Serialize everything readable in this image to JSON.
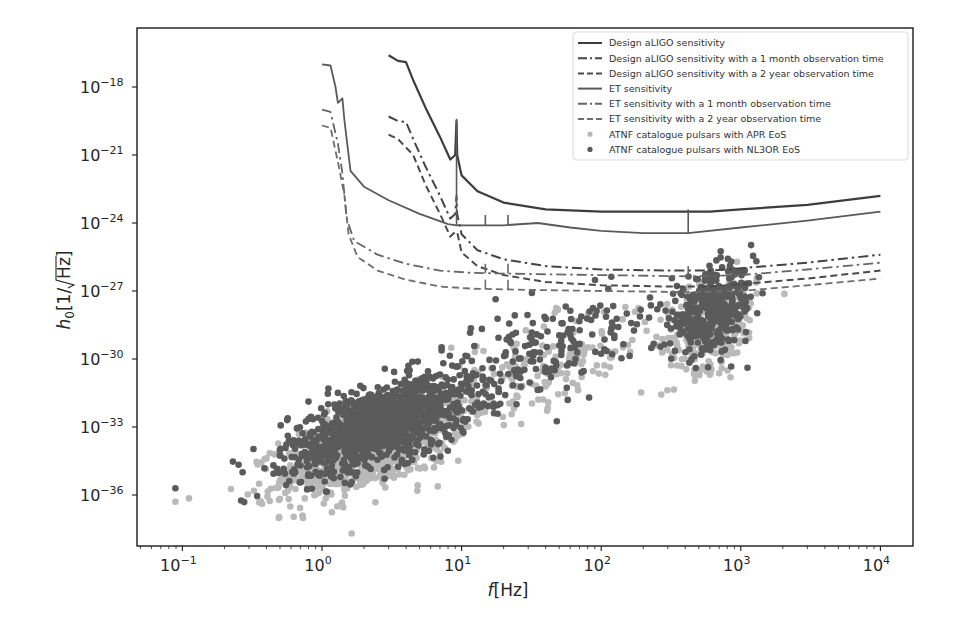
{
  "chart_data": {
    "type": "scatter",
    "title": "",
    "xlabel": "f[Hz]",
    "ylabel": "h0[1/√Hz]",
    "xscale": "log",
    "yscale": "log",
    "xlim": [
      0.05,
      20000
    ],
    "ylim": [
      1e-38,
      1e-16
    ],
    "grid": false,
    "legend_position": "upper right",
    "x_ticks": [
      {
        "exp": "−1",
        "value": 0.1
      },
      {
        "exp": "0",
        "value": 1
      },
      {
        "exp": "1",
        "value": 10
      },
      {
        "exp": "2",
        "value": 100
      },
      {
        "exp": "3",
        "value": 1000
      },
      {
        "exp": "4",
        "value": 10000
      }
    ],
    "y_ticks": [
      {
        "exp": "−18",
        "value": 1e-18
      },
      {
        "exp": "−21",
        "value": 1e-21
      },
      {
        "exp": "−24",
        "value": 1e-24
      },
      {
        "exp": "−27",
        "value": 1e-27
      },
      {
        "exp": "−30",
        "value": 1e-30
      },
      {
        "exp": "−33",
        "value": 1e-33
      },
      {
        "exp": "−36",
        "value": 1e-36
      }
    ],
    "series": [
      {
        "name": "Design aLIGO sensitivity",
        "kind": "line",
        "style": "solid",
        "color": "#3d3d3d",
        "width": 2.2,
        "points": [
          [
            3.0,
            -16.6
          ],
          [
            3.5,
            -16.85
          ],
          [
            4.0,
            -16.9
          ],
          [
            4.5,
            -17.7
          ],
          [
            5.5,
            -18.9
          ],
          [
            7,
            -20.2
          ],
          [
            8.3,
            -21.2
          ],
          [
            9.0,
            -21.0
          ],
          [
            9.2,
            -19.5
          ],
          [
            9.3,
            -21.0
          ],
          [
            10,
            -21.9
          ],
          [
            13,
            -22.6
          ],
          [
            20,
            -23.1
          ],
          [
            40,
            -23.4
          ],
          [
            100,
            -23.5
          ],
          [
            300,
            -23.5
          ],
          [
            600,
            -23.5
          ],
          [
            1000,
            -23.4
          ],
          [
            3000,
            -23.2
          ],
          [
            10000,
            -22.8
          ]
        ],
        "spikes": []
      },
      {
        "name": "Design aLIGO sensitivity with a 1 month observation time",
        "kind": "line",
        "style": "dashdot",
        "color": "#454545",
        "width": 2.0,
        "points": [
          [
            3.0,
            -19.3
          ],
          [
            3.5,
            -19.5
          ],
          [
            4.0,
            -19.55
          ],
          [
            4.5,
            -20.3
          ],
          [
            5.5,
            -21.5
          ],
          [
            7,
            -22.8
          ],
          [
            8.3,
            -23.8
          ],
          [
            9.0,
            -23.6
          ],
          [
            9.2,
            -22.8
          ],
          [
            9.3,
            -23.6
          ],
          [
            10,
            -24.5
          ],
          [
            13,
            -25.2
          ],
          [
            20,
            -25.6
          ],
          [
            40,
            -25.9
          ],
          [
            100,
            -26.05
          ],
          [
            300,
            -26.1
          ],
          [
            600,
            -26.1
          ],
          [
            1000,
            -26.0
          ],
          [
            3000,
            -25.75
          ],
          [
            10000,
            -25.4
          ]
        ],
        "spikes": []
      },
      {
        "name": "Design aLIGO sensitivity with a 2 year observation time",
        "kind": "line",
        "style": "dashed",
        "color": "#4a4a4a",
        "width": 2.0,
        "points": [
          [
            3.0,
            -20.1
          ],
          [
            3.5,
            -20.3
          ],
          [
            4.5,
            -21.0
          ],
          [
            5.5,
            -22.3
          ],
          [
            7,
            -23.6
          ],
          [
            8.3,
            -24.6
          ],
          [
            9.0,
            -24.4
          ],
          [
            9.3,
            -24.4
          ],
          [
            10,
            -25.3
          ],
          [
            13,
            -25.9
          ],
          [
            20,
            -26.3
          ],
          [
            40,
            -26.6
          ],
          [
            100,
            -26.75
          ],
          [
            300,
            -26.8
          ],
          [
            600,
            -26.8
          ],
          [
            1000,
            -26.7
          ],
          [
            3000,
            -26.45
          ],
          [
            10000,
            -26.1
          ]
        ],
        "spikes": []
      },
      {
        "name": "ET sensitivity",
        "kind": "line",
        "style": "solid",
        "color": "#5a5a5a",
        "width": 1.8,
        "points": [
          [
            1.0,
            -17.0
          ],
          [
            1.15,
            -17.05
          ],
          [
            1.25,
            -18.0
          ],
          [
            1.3,
            -18.7
          ],
          [
            1.4,
            -18.5
          ],
          [
            1.45,
            -19.5
          ],
          [
            1.6,
            -21.7
          ],
          [
            2,
            -22.4
          ],
          [
            3,
            -23.0
          ],
          [
            5,
            -23.6
          ],
          [
            8,
            -24.05
          ],
          [
            9.2,
            -24.1
          ],
          [
            12,
            -24.1
          ],
          [
            20,
            -24.1
          ],
          [
            35,
            -24.0
          ],
          [
            60,
            -24.2
          ],
          [
            100,
            -24.35
          ],
          [
            200,
            -24.45
          ],
          [
            420,
            -24.45
          ],
          [
            1000,
            -24.2
          ],
          [
            3000,
            -23.9
          ],
          [
            10000,
            -23.5
          ]
        ],
        "spikes": [
          [
            9.2,
            -19.4
          ],
          [
            14.8,
            -23.65
          ],
          [
            21.5,
            -23.65
          ],
          [
            420,
            -23.4
          ]
        ]
      },
      {
        "name": "ET sensitivity with a 1 month observation time",
        "kind": "line",
        "style": "dashdot",
        "color": "#666666",
        "width": 1.8,
        "points": [
          [
            1.0,
            -19.0
          ],
          [
            1.15,
            -19.1
          ],
          [
            1.3,
            -20.5
          ],
          [
            1.4,
            -21.8
          ],
          [
            1.5,
            -23.8
          ],
          [
            1.7,
            -24.8
          ],
          [
            2.5,
            -25.4
          ],
          [
            4,
            -25.8
          ],
          [
            7,
            -26.1
          ],
          [
            12,
            -26.2
          ],
          [
            30,
            -26.25
          ],
          [
            100,
            -26.3
          ],
          [
            420,
            -26.35
          ],
          [
            1000,
            -26.3
          ],
          [
            3000,
            -26.05
          ],
          [
            10000,
            -25.75
          ]
        ],
        "spikes": [
          [
            14.8,
            -25.8
          ],
          [
            21.5,
            -25.8
          ],
          [
            420,
            -25.9
          ]
        ]
      },
      {
        "name": "ET sensitivity with a 2 year observation time",
        "kind": "line",
        "style": "dashed",
        "color": "#6e6e6e",
        "width": 1.8,
        "points": [
          [
            1.0,
            -19.7
          ],
          [
            1.15,
            -19.8
          ],
          [
            1.3,
            -21.3
          ],
          [
            1.45,
            -22.8
          ],
          [
            1.55,
            -24.5
          ],
          [
            1.8,
            -25.5
          ],
          [
            2.5,
            -26.1
          ],
          [
            4,
            -26.5
          ],
          [
            7,
            -26.8
          ],
          [
            12,
            -26.9
          ],
          [
            30,
            -26.95
          ],
          [
            100,
            -27.0
          ],
          [
            420,
            -27.05
          ],
          [
            1000,
            -27.0
          ],
          [
            3000,
            -26.75
          ],
          [
            10000,
            -26.45
          ]
        ],
        "spikes": [
          [
            14.8,
            -26.5
          ],
          [
            21.5,
            -26.5
          ]
        ]
      },
      {
        "name": "ATNF catalogue pulsars with APR EoS",
        "kind": "scatter",
        "color": "#b9b9b9",
        "radius": 3.3,
        "clusters": [
          {
            "n": 1000,
            "logf_mean": 0.38,
            "logf_sd": 0.33,
            "logh_mean": -33.8,
            "logh_sd": 1.15,
            "corr": 0.6
          },
          {
            "n": 320,
            "logf_mean": 2.8,
            "logf_sd": 0.16,
            "logh_mean": -28.5,
            "logh_sd": 1.0,
            "corr": 0.3
          },
          {
            "n": 160,
            "logf_mean": 1.6,
            "logf_sd": 0.4,
            "logh_mean": -30.3,
            "logh_sd": 1.2,
            "corr": 0.6
          }
        ]
      },
      {
        "name": "ATNF catalogue pulsars with NL3OR EoS",
        "kind": "scatter",
        "color": "#5b5b5b",
        "radius": 3.3,
        "clusters": [
          {
            "n": 1250,
            "logf_mean": 0.42,
            "logf_sd": 0.33,
            "logh_mean": -32.9,
            "logh_sd": 1.05,
            "corr": 0.6
          },
          {
            "n": 380,
            "logf_mean": 2.8,
            "logf_sd": 0.15,
            "logh_mean": -27.9,
            "logh_sd": 0.9,
            "corr": 0.3
          },
          {
            "n": 180,
            "logf_mean": 1.6,
            "logf_sd": 0.4,
            "logh_mean": -29.6,
            "logh_sd": 1.2,
            "corr": 0.6
          }
        ],
        "outliers": [
          [
            -1.05,
            -35.7
          ],
          [
            -1.05,
            -36.3
          ]
        ]
      }
    ]
  },
  "legend": {
    "items": [
      {
        "label": "Design aLIGO sensitivity",
        "marker": "solid"
      },
      {
        "label": "Design aLIGO sensitivity with a 1 month observation time",
        "marker": "dashdot"
      },
      {
        "label": "Design aLIGO sensitivity with a 2 year observation time",
        "marker": "dashed"
      },
      {
        "label": "ET sensitivity",
        "marker": "solid"
      },
      {
        "label": "ET sensitivity with a 1 month observation time",
        "marker": "dashdot"
      },
      {
        "label": "ET sensitivity with a 2 year observation time",
        "marker": "dashed"
      },
      {
        "label": "ATNF catalogue pulsars with APR EoS",
        "marker": "dot"
      },
      {
        "label": "ATNF catalogue pulsars with NL3OR EoS",
        "marker": "dot"
      }
    ]
  },
  "axes": {
    "x_label_italic": "f",
    "x_label_rest": "[Hz]",
    "y_label_italic": "h",
    "y_label_sub": "0",
    "y_label_rest_open": "[1/",
    "y_label_sqrt": "Hz",
    "y_label_rest_close": "]",
    "tick_base": "10"
  }
}
